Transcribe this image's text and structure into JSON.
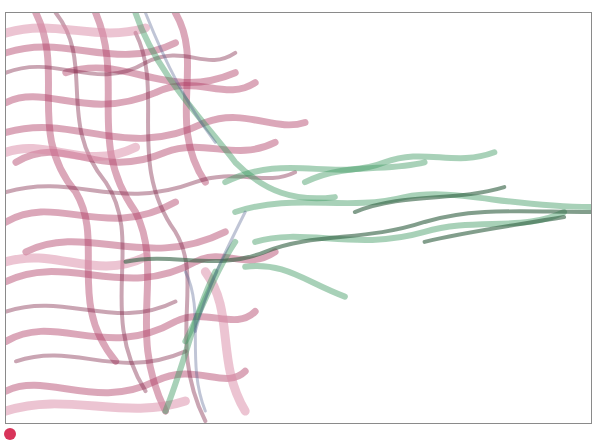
{
  "artwork": {
    "frame": {
      "border_color": "#8a8a8a",
      "background": "#ffffff"
    },
    "palette": {
      "crimson": "#b03c64",
      "crimson_dark": "#7a1f40",
      "pink_light": "#d98aa6",
      "green": "#3f9a62",
      "green_dark": "#2f5e3f",
      "slate_blue": "#4a5a8a"
    },
    "marker": {
      "color": "#d8345a"
    }
  }
}
